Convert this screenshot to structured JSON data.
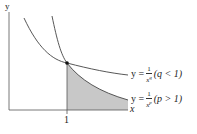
{
  "axes": {
    "x_label": "x",
    "y_label": "y",
    "x_tick": "1"
  },
  "curves": [
    {
      "name": "q",
      "lhs": "y =",
      "num": "1",
      "den": "x^q",
      "den_base": "x",
      "den_exp": "q",
      "cond": "(q < 1)"
    },
    {
      "name": "p",
      "lhs": "y =",
      "num": "1",
      "den": "x^p",
      "den_base": "x",
      "den_exp": "p",
      "cond": "(p > 1)"
    }
  ],
  "colors": {
    "curve": "#444444",
    "shade": "#c8c8c8",
    "axis": "#555555"
  }
}
